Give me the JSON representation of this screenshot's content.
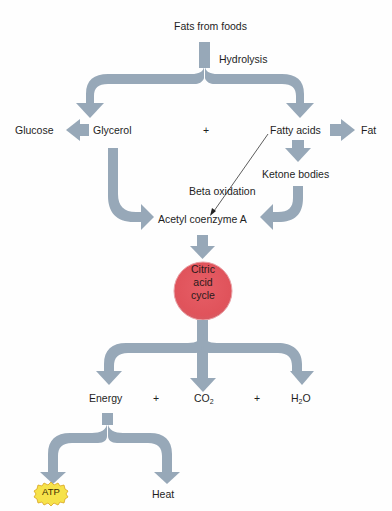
{
  "diagram": {
    "title": "Fats from foods",
    "process_label": "Hydrolysis",
    "nodes": {
      "fats_from_foods": "Fats from foods",
      "glucose": "Glucose",
      "glycerol": "Glycerol",
      "plus_1": "+",
      "fatty_acids": "Fatty acids",
      "fat": "Fat",
      "ketone_bodies": "Ketone bodies",
      "beta_oxidation": "Beta oxidation",
      "acetyl_coa": "Acetyl coenzyme A",
      "citric_acid_cycle": {
        "line1": "Citric",
        "line2": "acid",
        "line3": "cycle"
      },
      "energy": "Energy",
      "plus_2": "+",
      "co2": {
        "base": "CO",
        "sub": "2"
      },
      "plus_3": "+",
      "h2o": {
        "pre": "H",
        "sub": "2",
        "post": "O"
      },
      "atp": "ATP",
      "heat": "Heat"
    },
    "edges": [
      {
        "from": "Fats from foods",
        "to": "Glycerol",
        "label": "Hydrolysis"
      },
      {
        "from": "Fats from foods",
        "to": "Fatty acids",
        "label": "Hydrolysis"
      },
      {
        "from": "Glycerol",
        "to": "Glucose"
      },
      {
        "from": "Fatty acids",
        "to": "Fat"
      },
      {
        "from": "Fatty acids",
        "to": "Ketone bodies"
      },
      {
        "from": "Fatty acids",
        "to": "Acetyl coenzyme A",
        "label": "Beta oxidation"
      },
      {
        "from": "Glycerol",
        "to": "Acetyl coenzyme A"
      },
      {
        "from": "Ketone bodies",
        "to": "Acetyl coenzyme A"
      },
      {
        "from": "Acetyl coenzyme A",
        "to": "Citric acid cycle"
      },
      {
        "from": "Citric acid cycle",
        "to": "Energy"
      },
      {
        "from": "Citric acid cycle",
        "to": "CO2"
      },
      {
        "from": "Citric acid cycle",
        "to": "H2O"
      },
      {
        "from": "Energy",
        "to": "ATP"
      },
      {
        "from": "Energy",
        "to": "Heat"
      }
    ],
    "colors": {
      "arrow": "#97a8b8",
      "circle_fill": "#e2555e",
      "circle_edge": "#d9b0b3",
      "atp_fill": "#f6e24a",
      "atp_edge": "#d9a520",
      "text": "#1e1e1e"
    }
  }
}
